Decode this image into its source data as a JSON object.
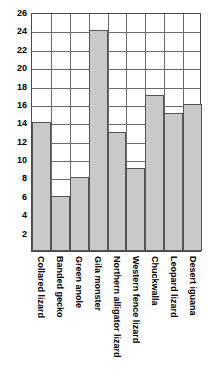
{
  "chart_data": {
    "type": "bar",
    "title": "",
    "subtitle": "",
    "xlabel": "",
    "ylabel": "",
    "ylim": [
      0,
      26
    ],
    "ytick_step": 2,
    "yticks": [
      2,
      4,
      6,
      8,
      10,
      12,
      14,
      16,
      18,
      20,
      22,
      24,
      26
    ],
    "ytick_labels": [
      "2",
      "4",
      "6",
      "8",
      "10",
      "12",
      "14",
      "16",
      "18",
      "20",
      "22",
      "24",
      "26"
    ],
    "grid": true,
    "grid_axes": "both",
    "legend": false,
    "legend_position": "none",
    "annotations": [],
    "categories": [
      "Collared lizard",
      "Banded gecko",
      "Green anole",
      "Gila monster",
      "Northern alligator lizard",
      "Western fence lizard",
      "Chuckwalla",
      "Leopard lizard",
      "Desert iguana"
    ],
    "values": [
      14,
      6,
      8,
      24,
      13,
      9,
      17,
      15,
      16
    ],
    "bar_fill_color": "#c9c9c9",
    "bar_edge_color": "#555555",
    "grid_color": "#6a6a6a",
    "axis_color": "#4a4a4a",
    "background_color": "#ffffff",
    "text_color": "#000000"
  }
}
